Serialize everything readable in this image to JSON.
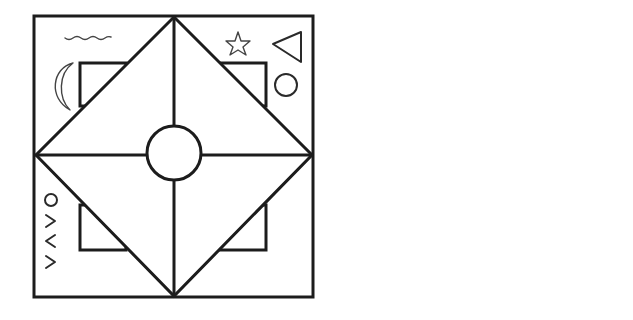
{
  "diagram": {
    "panels": [
      {
        "id": "left",
        "description": "Square divided by diagonal diamond and central cross with a central circle; corner squares partly hidden behind diamond; symbols in corners",
        "symbols": {
          "top_left": [
            "wavy-line",
            "crescent-moon"
          ],
          "top_right": [
            "outline-star",
            "triangle",
            "circle"
          ],
          "bottom_left": [
            "VAVO-glyphs",
            "mars-like-symbol"
          ],
          "bottom_right": [
            "wavy-vertical-line",
            "bell-curve"
          ]
        },
        "center": "circle"
      },
      {
        "id": "right",
        "description": "Square divided into four triangles by diagonals (X), symbol in each triangle",
        "symbols": {
          "top": "filled-star",
          "left": "aries-like-glyph",
          "right": "staff-with-hook",
          "bottom": "mars-like-symbol"
        }
      }
    ],
    "glyph_text": "VAVO",
    "colors": {
      "ink": "#1c1c1c",
      "background": "#ffffff"
    }
  }
}
